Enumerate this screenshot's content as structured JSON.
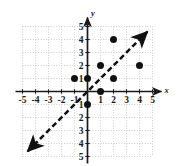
{
  "figure": {
    "kind": "coordinate-plane-scatter",
    "axis_labels": {
      "x": "x",
      "y": "y"
    },
    "x_ticks": [
      "-5",
      "-4",
      "-3",
      "-2",
      "-1",
      "1",
      "2",
      "3",
      "4",
      "5"
    ],
    "y_ticks": [
      "5",
      "4",
      "3",
      "2",
      "1",
      "1",
      "2",
      "3",
      "4",
      "5"
    ],
    "colors": {
      "ink": "#1a1a1a",
      "grid": "#b9b9b9",
      "point": "#111111",
      "line": "#111111"
    }
  },
  "chart_data": {
    "type": "scatter",
    "title": "",
    "xlabel": "x",
    "ylabel": "y",
    "xlim": [
      -5,
      5
    ],
    "ylim": [
      -5,
      5
    ],
    "grid": true,
    "legend": "none",
    "points": [
      {
        "x": -1,
        "y": 1
      },
      {
        "x": 0,
        "y": 1
      },
      {
        "x": 0,
        "y": -1
      },
      {
        "x": 1,
        "y": 0
      },
      {
        "x": 1,
        "y": 2
      },
      {
        "x": 2,
        "y": 1
      },
      {
        "x": 2,
        "y": 4
      },
      {
        "x": 4,
        "y": 2
      }
    ],
    "annotations": [
      {
        "kind": "line",
        "style": "dashed",
        "arrows": "both",
        "equation": "y = x",
        "from": {
          "x": -4.6,
          "y": -4.6
        },
        "to": {
          "x": 4.6,
          "y": 4.6
        }
      }
    ]
  }
}
